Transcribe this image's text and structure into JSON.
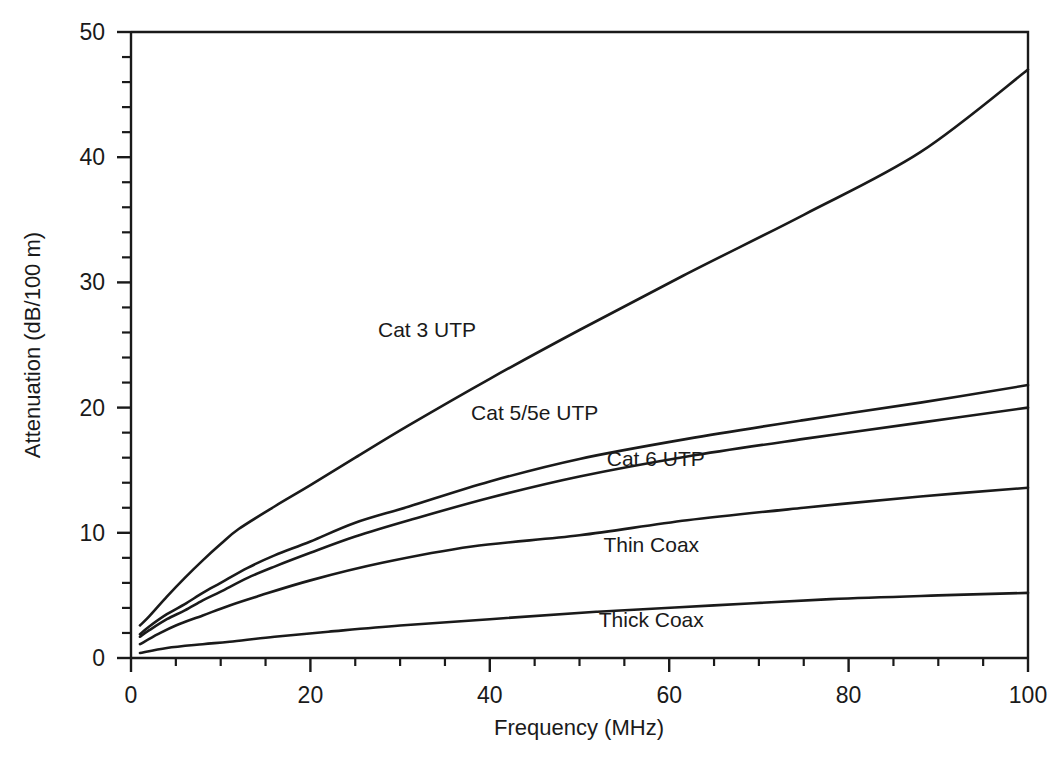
{
  "figure": {
    "caption": "",
    "background": "#ffffff",
    "ink_color": "#1a1a1a"
  },
  "chart_data": {
    "type": "line",
    "title": "",
    "xlabel": "Frequency (MHz)",
    "ylabel": "Attenuation (dB/100 m)",
    "xlim": [
      0,
      100
    ],
    "ylim": [
      0,
      50
    ],
    "x_major_ticks": [
      0,
      20,
      40,
      60,
      80,
      100
    ],
    "x_tick_labels": [
      "0",
      "20",
      "40",
      "60",
      "80",
      "100"
    ],
    "x_minor_step": 5,
    "y_major_ticks": [
      0,
      10,
      20,
      30,
      40,
      50
    ],
    "y_tick_labels": [
      "0",
      "10",
      "20",
      "30",
      "40",
      "50"
    ],
    "y_minor_step": 2,
    "grid": false,
    "legend_position": "inline-annotations",
    "series": [
      {
        "name": "Cat 3 UTP",
        "label": "Cat 3 UTP",
        "label_x": 33,
        "label_y": 25.6,
        "x": [
          1,
          2,
          4,
          6,
          8,
          10,
          12,
          16,
          20,
          25,
          31,
          40,
          50,
          62,
          75,
          88,
          100
        ],
        "y": [
          2.6,
          3.3,
          4.9,
          6.4,
          7.8,
          9.1,
          10.3,
          12.1,
          13.8,
          16.0,
          18.6,
          22.3,
          26.2,
          30.7,
          35.4,
          40.4,
          47.0
        ]
      },
      {
        "name": "Cat 5/5e UTP",
        "label": "Cat 5/5e UTP",
        "label_x": 45,
        "label_y": 19.0,
        "x": [
          1,
          2,
          4,
          6,
          8,
          10,
          13,
          16,
          20,
          25,
          31,
          40,
          50,
          62,
          75,
          88,
          100
        ],
        "y": [
          1.9,
          2.5,
          3.5,
          4.3,
          5.2,
          6.0,
          7.2,
          8.2,
          9.3,
          10.8,
          12.1,
          14.1,
          15.9,
          17.5,
          19.0,
          20.4,
          21.8
        ]
      },
      {
        "name": "Cat 6 UTP",
        "label": "Cat 6 UTP",
        "label_x": 58.5,
        "label_y": 15.3,
        "x": [
          1,
          2,
          4,
          6,
          8,
          10,
          13,
          16,
          20,
          25,
          31,
          40,
          50,
          62,
          75,
          88,
          100
        ],
        "y": [
          1.7,
          2.2,
          3.1,
          3.8,
          4.6,
          5.3,
          6.4,
          7.3,
          8.4,
          9.7,
          11.0,
          12.8,
          14.5,
          16.1,
          17.5,
          18.8,
          20.0
        ]
      },
      {
        "name": "Thin Coax",
        "label": "Thin Coax",
        "label_x": 58,
        "label_y": 8.5,
        "x": [
          1,
          3,
          5,
          8,
          11,
          14,
          20,
          28,
          38,
          50,
          62,
          75,
          88,
          100
        ],
        "y": [
          1.1,
          1.9,
          2.6,
          3.4,
          4.2,
          4.9,
          6.2,
          7.6,
          8.9,
          9.8,
          11.0,
          12.0,
          12.9,
          13.6
        ]
      },
      {
        "name": "Thick Coax",
        "label": "Thick Coax",
        "label_x": 58,
        "label_y": 2.5,
        "x": [
          1,
          4,
          8,
          11,
          16,
          22,
          30,
          40,
          52,
          65,
          78,
          90,
          100
        ],
        "y": [
          0.4,
          0.8,
          1.1,
          1.3,
          1.7,
          2.1,
          2.6,
          3.1,
          3.7,
          4.2,
          4.7,
          5.0,
          5.2
        ]
      }
    ]
  }
}
